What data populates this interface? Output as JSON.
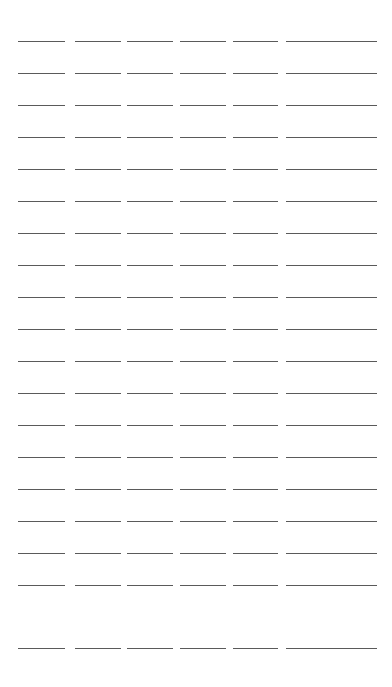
{
  "page": {
    "width": 392,
    "height": 687,
    "background_color": "#ffffff"
  },
  "grid": {
    "rows": 19,
    "columns": 7,
    "row_pitch": 32.0,
    "column_pitch": 53.0,
    "first_row_y": 41,
    "first_column_x": 18,
    "segment_width": 46,
    "segment_gap": 7,
    "line_thickness": 1,
    "line_color": "#5a5a5a",
    "left_margin": 18,
    "right_margin": 20,
    "top_margin": 38,
    "bottom_margin": 39
  },
  "segment_widths": [
    47,
    46,
    46,
    46,
    45,
    45,
    47
  ],
  "rows_y": [
    41,
    73,
    105,
    137,
    169,
    201,
    233,
    265,
    297,
    329,
    361,
    393,
    425,
    457,
    489,
    521,
    553,
    585,
    648
  ],
  "columns_x": [
    18,
    75,
    127,
    180,
    233,
    286,
    330
  ],
  "labels": {
    "segment_name": "redacted-line",
    "row_name": "redacted-line-row"
  }
}
